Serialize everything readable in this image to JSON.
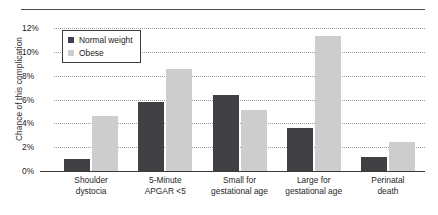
{
  "chart_data": {
    "type": "bar",
    "title": "",
    "xlabel": "",
    "ylabel": "Chance of this complication",
    "ylim": [
      0,
      12
    ],
    "ytick_labels": [
      "0%",
      "2%",
      "4%",
      "6%",
      "8%",
      "10%",
      "12%"
    ],
    "ytick_values": [
      0,
      2,
      4,
      6,
      8,
      10,
      12
    ],
    "grid": true,
    "legend_position": "top-left",
    "categories": [
      "Shoulder dystocia",
      "5-Minute APGAR <5",
      "Small for gestational age",
      "Large for gestational age",
      "Perinatal death"
    ],
    "category_lines": [
      [
        "Shoulder",
        "dystocia"
      ],
      [
        "5-Minute",
        "APGAR <5"
      ],
      [
        "Small for",
        "gestational age"
      ],
      [
        "Large for",
        "gestational age"
      ],
      [
        "Perinatal",
        "death"
      ]
    ],
    "series": [
      {
        "name": "Normal weight",
        "color": "#404045",
        "values": [
          1.0,
          5.8,
          6.4,
          3.6,
          1.2
        ]
      },
      {
        "name": "Obese",
        "color": "#cdcdcd",
        "values": [
          4.6,
          8.6,
          5.1,
          11.3,
          2.4
        ]
      }
    ]
  },
  "legend": {
    "items": [
      {
        "label": "Normal weight",
        "swatch": "normal"
      },
      {
        "label": "Obese",
        "swatch": "obese"
      }
    ]
  },
  "colors": {
    "normal_weight": "#404045",
    "obese": "#cdcdcd",
    "gridline": "#9a9a9a",
    "axis": "#3a3a3a",
    "background": "#ffffff"
  }
}
